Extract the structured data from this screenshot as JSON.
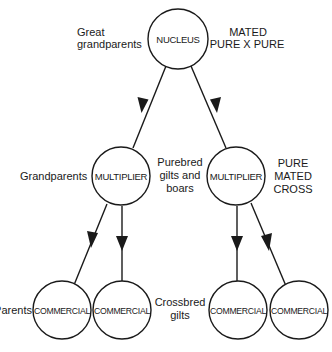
{
  "diagram": {
    "type": "breeding-pyramid",
    "colors": {
      "stroke": "#1a1a1a",
      "background": "#ffffff"
    },
    "nodes": {
      "nucleus": {
        "label": "NUCLEUS"
      },
      "multiplier_left": {
        "label": "MULTIPLIER"
      },
      "multiplier_right": {
        "label": "MULTIPLIER"
      },
      "commercial_1": {
        "label": "COMMERCIAL"
      },
      "commercial_2": {
        "label": "COMMERCIAL"
      },
      "commercial_3": {
        "label": "COMMERCIAL"
      },
      "commercial_4": {
        "label": "COMMERCIAL"
      }
    },
    "annotations": {
      "great_grandparents": {
        "line1": "Great",
        "line2": "grandparents"
      },
      "mated_pure": {
        "line1": "MATED",
        "line2": "PURE X PURE"
      },
      "grandparents": {
        "line1": "Grandparents"
      },
      "purebred": {
        "line1": "Purebred",
        "line2": "gilts and",
        "line3": "boars"
      },
      "pure_mated_cross": {
        "line1": "PURE",
        "line2": "MATED",
        "line3": "CROSS"
      },
      "parents": {
        "line1": "Parents"
      },
      "crossbred": {
        "line1": "Crossbred",
        "line2": "gilts"
      }
    },
    "edges": [
      {
        "from": "NUCLEUS",
        "to": "MULTIPLIER (left)"
      },
      {
        "from": "NUCLEUS",
        "to": "MULTIPLIER (right)"
      },
      {
        "from": "MULTIPLIER (left)",
        "to": "COMMERCIAL 1"
      },
      {
        "from": "MULTIPLIER (left)",
        "to": "COMMERCIAL 2"
      },
      {
        "from": "MULTIPLIER (right)",
        "to": "COMMERCIAL 3"
      },
      {
        "from": "MULTIPLIER (right)",
        "to": "COMMERCIAL 4"
      }
    ]
  }
}
